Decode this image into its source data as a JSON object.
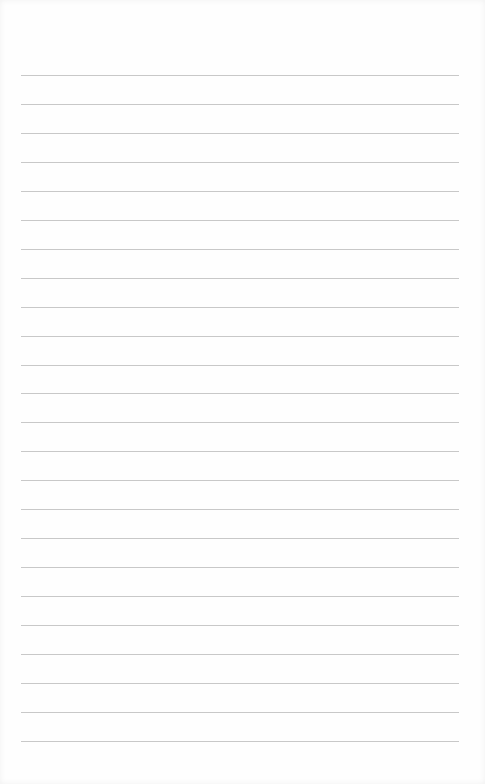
{
  "page": {
    "type": "lined-notepaper",
    "line_count": 24,
    "first_line_y": 75,
    "line_spacing": 28.95,
    "line_left": 21,
    "line_width": 438,
    "line_color": "#c8c8c8",
    "background_color": "#fefefe"
  }
}
